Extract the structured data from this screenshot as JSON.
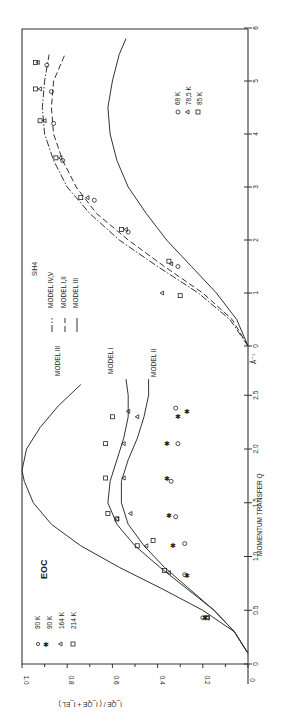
{
  "chart_data": [
    {
      "type": "line",
      "panel": "upper",
      "orientation": "rotated 90deg counter-clockwise",
      "title": "SiH4",
      "xlabel": "Å-1",
      "ylabel": "I_QE / (I_QE + I_EL)",
      "xlim": [
        0,
        6
      ],
      "ylim": [
        0,
        1.0
      ],
      "x_ticks": [
        "0",
        "1",
        "2",
        "3",
        "4",
        "5",
        "6"
      ],
      "legend_models": [
        {
          "label": "MODEL IV,V",
          "style": "dash-dot"
        },
        {
          "label": "MODEL I,II",
          "style": "dashed"
        },
        {
          "label": "MODEL III",
          "style": "solid"
        }
      ],
      "legend_temps": [
        {
          "marker": "circle",
          "label": "68 K"
        },
        {
          "marker": "triangle",
          "label": "78.5 K"
        },
        {
          "marker": "square",
          "label": "85 K"
        }
      ],
      "series": [
        {
          "name": "MODEL IV,V",
          "x": [
            0,
            0.5,
            1,
            1.5,
            2,
            2.5,
            3,
            3.5,
            4,
            4.5,
            5,
            5.5
          ],
          "values": [
            0,
            0.08,
            0.22,
            0.4,
            0.57,
            0.7,
            0.8,
            0.86,
            0.9,
            0.91,
            0.9,
            0.88
          ]
        },
        {
          "name": "MODEL I,II",
          "x": [
            0,
            0.5,
            1,
            1.5,
            2,
            2.5,
            3,
            3.5,
            4,
            4.5,
            5,
            5.5
          ],
          "values": [
            0,
            0.07,
            0.2,
            0.37,
            0.53,
            0.67,
            0.76,
            0.82,
            0.86,
            0.87,
            0.86,
            0.81
          ]
        },
        {
          "name": "MODEL III",
          "x": [
            0,
            0.5,
            1,
            1.5,
            2,
            2.5,
            3,
            3.5,
            4,
            4.5,
            5,
            5.5,
            5.8
          ],
          "values": [
            0,
            0.05,
            0.14,
            0.25,
            0.36,
            0.45,
            0.53,
            0.58,
            0.61,
            0.62,
            0.6,
            0.57,
            0.54
          ]
        },
        {
          "name": "68 K",
          "x": [
            1.5,
            2.15,
            2.75,
            3.5,
            4.2,
            4.8,
            5.3
          ],
          "values": [
            0.31,
            0.53,
            0.68,
            0.82,
            0.86,
            0.87,
            0.89
          ]
        },
        {
          "name": "78.5 K",
          "x": [
            1.0,
            1.55,
            2.2,
            2.8,
            3.55,
            4.25,
            4.85,
            5.35
          ],
          "values": [
            0.38,
            0.34,
            0.54,
            0.71,
            0.83,
            0.9,
            0.92,
            0.93
          ]
        },
        {
          "name": "85 K",
          "x": [
            0.95,
            1.6,
            2.2,
            2.8,
            3.55,
            4.25,
            4.85,
            5.35
          ],
          "values": [
            0.3,
            0.35,
            0.56,
            0.74,
            0.85,
            0.92,
            0.94,
            0.94
          ]
        }
      ]
    },
    {
      "type": "line",
      "panel": "lower",
      "orientation": "rotated 90deg counter-clockwise",
      "title": "EOC",
      "xlabel": "MOMENTUM TRANSFER Q",
      "ylabel": "I_QE / (I_QE + I_EL)",
      "xlim": [
        0,
        2.8
      ],
      "ylim": [
        0,
        1.0
      ],
      "x_ticks": [
        "0",
        "0.5",
        "1.0",
        "1.5",
        "2.0",
        "2.5"
      ],
      "y_ticks": [
        "0",
        "0.2",
        "0.4",
        "0.6",
        "0.8",
        "1.0"
      ],
      "legend_temps": [
        {
          "marker": "circle",
          "label": "90 K"
        },
        {
          "marker": "asterisk",
          "label": "90 K"
        },
        {
          "marker": "triangle",
          "label": "164 K"
        },
        {
          "marker": "square",
          "label": "214 K"
        }
      ],
      "annotations": [
        "MODEL III",
        "MODEL I",
        "MODEL II"
      ],
      "series": [
        {
          "name": "MODEL III",
          "x": [
            0.1,
            0.3,
            0.5,
            0.7,
            0.9,
            1.1,
            1.3,
            1.5,
            1.7,
            1.8,
            2.0,
            2.2,
            2.4,
            2.6
          ],
          "values": [
            0,
            0.06,
            0.2,
            0.38,
            0.57,
            0.74,
            0.87,
            0.95,
            0.99,
            1.0,
            0.98,
            0.92,
            0.84,
            0.74
          ]
        },
        {
          "name": "MODEL I",
          "x": [
            0.1,
            0.3,
            0.5,
            0.7,
            0.9,
            1.1,
            1.3,
            1.5,
            1.7,
            1.9,
            2.1,
            2.3,
            2.5,
            2.65
          ],
          "values": [
            0,
            0.06,
            0.15,
            0.27,
            0.39,
            0.5,
            0.58,
            0.62,
            0.61,
            0.58,
            0.55,
            0.53,
            0.53,
            0.54
          ]
        },
        {
          "name": "MODEL II",
          "x": [
            0.1,
            0.3,
            0.5,
            0.7,
            0.9,
            1.1,
            1.3,
            1.5,
            1.7,
            1.9,
            2.1,
            2.3,
            2.5,
            2.65
          ],
          "values": [
            0,
            0.06,
            0.15,
            0.26,
            0.37,
            0.46,
            0.53,
            0.56,
            0.56,
            0.53,
            0.49,
            0.46,
            0.44,
            0.44
          ]
        },
        {
          "name": "90 K (circle)",
          "x": [
            0.43,
            0.83,
            1.12,
            1.37,
            1.7,
            2.05,
            2.38
          ],
          "values": [
            0.2,
            0.28,
            0.28,
            0.32,
            0.34,
            0.31,
            0.32
          ]
        },
        {
          "name": "90 K (asterisk)",
          "x": [
            0.43,
            0.82,
            1.1,
            1.38,
            1.73,
            2.05,
            2.3,
            2.35
          ],
          "values": [
            0.19,
            0.27,
            0.33,
            0.35,
            0.36,
            0.36,
            0.31,
            0.27
          ]
        },
        {
          "name": "164 K",
          "x": [
            0.43,
            0.85,
            1.1,
            1.35,
            1.4,
            1.73,
            2.05,
            2.3,
            2.35
          ],
          "values": [
            0.18,
            0.35,
            0.45,
            0.58,
            0.52,
            0.55,
            0.55,
            0.49,
            0.53
          ]
        },
        {
          "name": "214 K",
          "x": [
            0.43,
            0.87,
            1.1,
            1.15,
            1.35,
            1.4,
            1.73,
            2.05,
            2.3
          ],
          "values": [
            0.18,
            0.37,
            0.49,
            0.42,
            0.58,
            0.62,
            0.63,
            0.63,
            0.6
          ]
        }
      ]
    }
  ],
  "labels": {
    "upper_title": "SiH4",
    "upper_unit": "Å⁻¹",
    "legend_model_iv_v": "MODEL IV,V",
    "legend_model_i_ii": "MODEL I,II",
    "legend_model_iii": "MODEL III",
    "temp_68": "68 K",
    "temp_785": "78,5 K",
    "temp_85": "85 K",
    "lower_title": "EOC",
    "temp_90a": "90 K",
    "temp_90b": "90 K",
    "temp_164": "164 K",
    "temp_214": "214 K",
    "ann_model_iii": "MODEL III",
    "ann_model_i": "MODEL I",
    "ann_model_ii": "MODEL II",
    "xlabel": "MOMENTUM  TRANSFER  Q",
    "ylabel": "I_QE / ( I_QE + I_EL )",
    "upper_ticks": [
      "0",
      "1",
      "2",
      "3",
      "4",
      "5",
      "6"
    ],
    "lower_ticks": [
      "0",
      "0.5",
      "1.0",
      "1.5",
      "2.0",
      "2.5"
    ],
    "y_ticks": [
      "1.0",
      "0.8",
      "0.6",
      "0.4",
      "0.2",
      "0"
    ]
  }
}
